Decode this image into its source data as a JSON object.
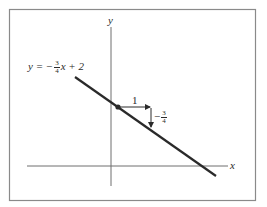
{
  "diagram": {
    "equation": {
      "lhs": "y = −",
      "frac_num": "3",
      "frac_den": "4",
      "rhs": "x + 2"
    },
    "axes": {
      "x_label": "x",
      "y_label": "y"
    },
    "slope_triangle": {
      "run_label": "1",
      "rise_sign": "−",
      "rise_num": "3",
      "rise_den": "4"
    },
    "colors": {
      "frame": "#8a8a8a",
      "axes": "#6e6e6e",
      "line": "#2a2a2a",
      "background": "#ffffff"
    }
  }
}
